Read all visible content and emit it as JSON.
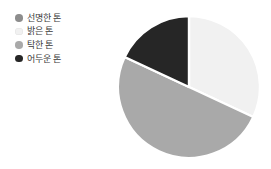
{
  "chart_data": {
    "type": "pie",
    "title": "",
    "subtitle": "",
    "xlabel": "",
    "ylabel": "",
    "grid": false,
    "legend_position": "top-left",
    "start_angle_deg": 0,
    "direction": "clockwise",
    "categories": [
      "선명한 톤",
      "밝은 톤",
      "탁한 톤",
      "어두운 톤"
    ],
    "values": [
      0,
      32,
      50,
      18
    ],
    "unit": "%",
    "slice_colors": [
      "#8d8d8d",
      "#f1f1f1",
      "#a9a9a9",
      "#262626"
    ],
    "slices": [
      {
        "label": "선명한 톤",
        "value": 0,
        "color": "#8d8d8d",
        "start_deg": 0,
        "end_deg": 0
      },
      {
        "label": "밝은 톤",
        "value": 32,
        "color": "#f1f1f1",
        "start_deg": 0,
        "end_deg": 115
      },
      {
        "label": "탁한 톤",
        "value": 50,
        "color": "#a9a9a9",
        "start_deg": 115,
        "end_deg": 295
      },
      {
        "label": "어두운 톤",
        "value": 18,
        "color": "#262626",
        "start_deg": 295,
        "end_deg": 360
      }
    ],
    "annotations": [],
    "data_labels_shown": false
  },
  "legend": {
    "items": [
      {
        "label": "선명한 톤",
        "color": "#8d8d8d",
        "marker": "filled-circle-icon"
      },
      {
        "label": "밝은 톤",
        "color": "#f1f1f1",
        "marker": "filled-circle-icon"
      },
      {
        "label": "탁한 톤",
        "color": "#a9a9a9",
        "marker": "filled-circle-icon"
      },
      {
        "label": "어두운 톤",
        "color": "#262626",
        "marker": "filled-circle-icon"
      }
    ]
  },
  "colors": {
    "background": "#ffffff",
    "slice_separator": "#ffffff",
    "legend_text": "#3a3a3a"
  },
  "pie_geometry": {
    "center_x": 72,
    "center_y": 74,
    "radius": 71
  }
}
